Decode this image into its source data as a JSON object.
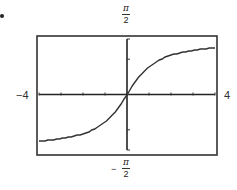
{
  "chart_data": {
    "type": "line",
    "title": "",
    "function": "y = arctan(x)",
    "xlabel": "",
    "ylabel": "",
    "xlim": [
      -4,
      4
    ],
    "ylim": [
      -1.5708,
      1.5708
    ],
    "x_tick_labels": {
      "left": "−4",
      "right": "4"
    },
    "y_tick_labels": {
      "top": "π/2",
      "bottom": "−π/2"
    },
    "x_ticks": [
      -4,
      -3,
      -2,
      -1,
      0,
      1,
      2,
      3,
      4
    ],
    "y_ticks": [
      -1.5708,
      -1,
      0,
      1,
      1.5708
    ],
    "grid": false,
    "legend": null,
    "series": [
      {
        "name": "arctan(x)",
        "x": [
          -4,
          -3.5,
          -3,
          -2.5,
          -2,
          -1.5,
          -1,
          -0.5,
          0,
          0.5,
          1,
          1.5,
          2,
          2.5,
          3,
          3.5,
          4
        ],
        "values": [
          -1.326,
          -1.292,
          -1.249,
          -1.19,
          -1.107,
          -0.983,
          -0.785,
          -0.464,
          0,
          0.464,
          0.785,
          0.983,
          1.107,
          1.19,
          1.249,
          1.292,
          1.326
        ]
      }
    ]
  },
  "labels": {
    "top_num": "π",
    "top_den": "2",
    "bottom_sign": "−",
    "bottom_num": "π",
    "bottom_den": "2",
    "left": "−4",
    "right": "4"
  }
}
